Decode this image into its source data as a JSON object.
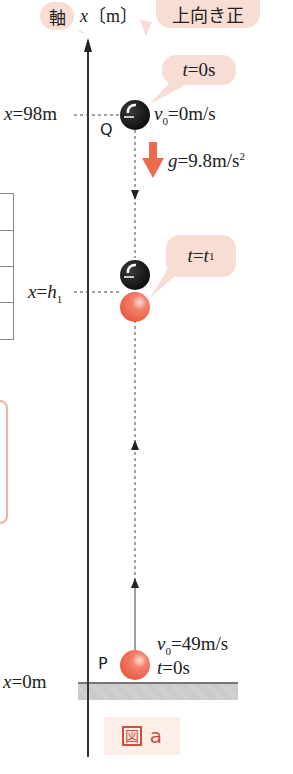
{
  "axis": {
    "kanji_label": "軸",
    "variable": "x",
    "unit": "〔m〕",
    "direction_note": "上向き正"
  },
  "markers": {
    "top": {
      "label_var": "x",
      "label_eq": "=98",
      "label_unit": "m"
    },
    "mid": {
      "label_var": "x",
      "label_eq": "=",
      "label_h": "h",
      "label_sub": "1"
    },
    "bottom": {
      "label_var": "x",
      "label_eq": "=0",
      "label_unit": "m"
    }
  },
  "ball_q": {
    "name": "Q",
    "bubble_t": "t",
    "bubble_rest": "=0s",
    "v_var": "v",
    "v_sub": "0",
    "v_rest": "=0m/s",
    "color": "#1a1a1a"
  },
  "gravity": {
    "var": "g",
    "rest": "=9.8m/s",
    "sup": "2",
    "arrow_color": "#ef6a4c"
  },
  "meeting": {
    "bubble_t": "t",
    "bubble_eq": "=",
    "bubble_t1": "t",
    "bubble_sub": "1"
  },
  "ball_p": {
    "name": "P",
    "v_var": "v",
    "v_sub": "0",
    "v_rest": "=49m/s",
    "t_var": "t",
    "t_rest": "=0s",
    "color": "#ee6a55"
  },
  "figure": {
    "kanji": "図",
    "letter": "a"
  },
  "colors": {
    "bubble": "#f8ddd5",
    "accent": "#c8503c",
    "ground": "#cccccc"
  }
}
